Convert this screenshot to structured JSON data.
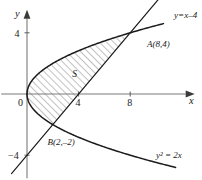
{
  "figure": {
    "axes": {
      "x_label": "x",
      "y_label": "y",
      "origin_label": "0"
    },
    "ticks": {
      "x": [
        {
          "value": 4,
          "label": "4"
        },
        {
          "value": 8,
          "label": "8"
        }
      ],
      "y": [
        {
          "value": 4,
          "label": "4"
        },
        {
          "value": -4,
          "label": "−4"
        }
      ]
    },
    "labels": {
      "line_equation": "y=x–4",
      "curve_equation": "y² = 2x",
      "point_a": "A(8,4)",
      "point_b": "B(2,–2)",
      "region": "S"
    },
    "colors": {
      "axis": "#7a7a7a",
      "curve": "#1b1b1b",
      "hatch": "#555555",
      "text": "#1a1a1a",
      "background": "#ffffff"
    }
  },
  "chart_data": {
    "type": "line",
    "xlabel": "x",
    "ylabel": "y",
    "xlim": [
      -2,
      13
    ],
    "ylim": [
      -5.5,
      5.5
    ],
    "grid": false,
    "legend": "none",
    "series": [
      {
        "name": "y² = 2x",
        "equation": "y^2 = 2x",
        "type": "parabola",
        "opens": "right",
        "vertex": [
          0,
          0
        ],
        "t_range": [
          -4.8,
          4.6
        ]
      },
      {
        "name": "y=x–4",
        "equation": "y = x - 4",
        "type": "line",
        "slope": 1,
        "intercept": -4,
        "x_range": [
          -1.2,
          12.2
        ]
      }
    ],
    "intersections": [
      {
        "label": "A(8,4)",
        "x": 8,
        "y": 4
      },
      {
        "label": "B(2,–2)",
        "x": 2,
        "y": -2
      }
    ],
    "shaded_region": {
      "label": "S",
      "bounded_by": [
        "y² = 2x",
        "y = x – 4"
      ],
      "y_range": [
        -2,
        4
      ],
      "hatch": "diagonal-45"
    },
    "annotations": [
      {
        "text": "y=x–4",
        "x": 11.4,
        "y": 5.0
      },
      {
        "text": "A(8,4)",
        "x": 9.3,
        "y": 3.1
      },
      {
        "text": "B(2,–2)",
        "x": 1.6,
        "y": -3.3
      },
      {
        "text": "y² = 2x",
        "x": 10.0,
        "y": -4.2
      },
      {
        "text": "S",
        "x": 3.5,
        "y": 1.1
      }
    ]
  }
}
